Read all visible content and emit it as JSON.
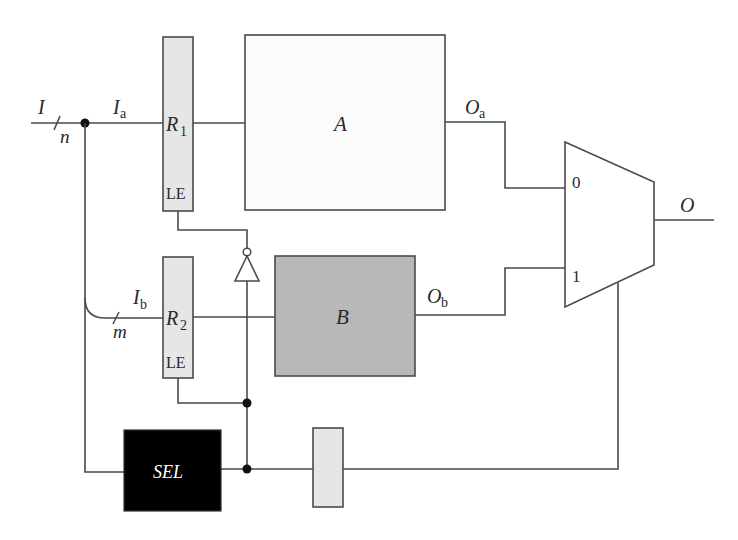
{
  "diagram": {
    "colors": {
      "wire": "#4a4a4a",
      "register_fill": "#e6e6e6",
      "block_a_fill": "#fbfbfb",
      "block_b_fill": "#b8b8b8",
      "sel_fill": "#000000",
      "sel_text": "#ffffff"
    },
    "inputs": {
      "I": {
        "label": "I",
        "width": "n"
      },
      "Ia": {
        "label": "I",
        "sub": "a"
      },
      "Ib": {
        "label": "I",
        "sub": "b",
        "width": "m"
      }
    },
    "registers": {
      "R1": {
        "label": "R",
        "sub": "1",
        "enable": "LE"
      },
      "R2": {
        "label": "R",
        "sub": "2",
        "enable": "LE"
      }
    },
    "blocks": {
      "A": {
        "label": "A"
      },
      "B": {
        "label": "B"
      },
      "SEL": {
        "label": "SEL"
      }
    },
    "outputs": {
      "Oa": {
        "label": "O",
        "sub": "a"
      },
      "Ob": {
        "label": "O",
        "sub": "b"
      },
      "O": {
        "label": "O"
      }
    },
    "mux": {
      "input0": "0",
      "input1": "1"
    }
  }
}
